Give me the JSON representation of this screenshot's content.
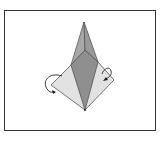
{
  "diagram": {
    "colors": {
      "frame": "#333333",
      "light_paper": "#e2e2e2",
      "mid_paper": "#a8a8a8",
      "dark_paper": "#8f8f8f",
      "line": "#555555",
      "arrow": "#222222"
    },
    "arrows": [
      {
        "name": "left-fold-arrow",
        "direction": "fold behind, curving down-right"
      },
      {
        "name": "right-fold-arrow",
        "direction": "fold behind, curving down-left"
      }
    ]
  }
}
